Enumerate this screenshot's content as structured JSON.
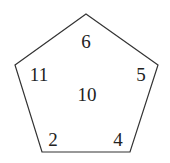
{
  "diagram": {
    "shape": "pentagon",
    "stroke_color": "#333333",
    "vertices": [
      [
        86,
        14
      ],
      [
        158,
        65
      ],
      [
        130,
        152
      ],
      [
        42,
        152
      ],
      [
        15,
        65
      ]
    ],
    "labels": {
      "top": "6",
      "left": "11",
      "right": "5",
      "center": "10",
      "bottom_left": "2",
      "bottom_right": "4"
    }
  }
}
